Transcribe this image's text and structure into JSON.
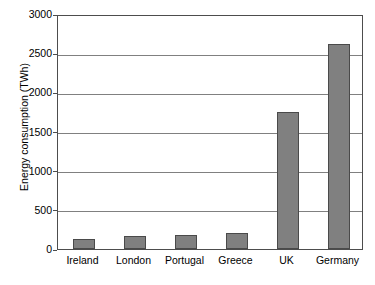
{
  "chart_data": {
    "type": "bar",
    "title": "",
    "xlabel": "",
    "ylabel": "Energy consumption (TWh)",
    "categories": [
      "Ireland",
      "London",
      "Portugal",
      "Greece",
      "UK",
      "Germany"
    ],
    "values": [
      130,
      165,
      180,
      205,
      1750,
      2620
    ],
    "ylim": [
      0,
      3000
    ],
    "yticks": [
      0,
      500,
      1000,
      1500,
      2000,
      2500,
      3000
    ],
    "ytick_labels": [
      "0",
      "500",
      "1000",
      "1500",
      "2000",
      "2500",
      "3000"
    ],
    "grid": true,
    "grid_axis": "y",
    "legend": false,
    "legend_position": "none",
    "bar_color": "#808080",
    "bar_edge_color": "#4a4a4a",
    "gridline_color": "#808080",
    "axis_color": "#4d4d4d",
    "background_color": "#ffffff",
    "text_color": "#000000"
  }
}
